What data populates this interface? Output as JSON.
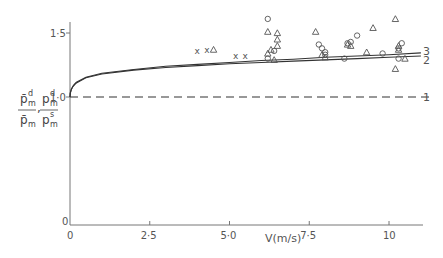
{
  "chart_data": {
    "type": "scatter",
    "title": "",
    "xlabel": "V(m/s)",
    "ylabel": "p̄_m^d / p̄_m , p_m^d / p_m^s",
    "xlim": [
      0,
      11.5
    ],
    "ylim": [
      0,
      1.6
    ],
    "x_ticks": [
      "0",
      "2·5",
      "5·0",
      "7·5",
      "10"
    ],
    "x_tick_values": [
      0,
      2.5,
      5.0,
      7.5,
      10
    ],
    "y_ticks": [
      "0",
      "1·0",
      "1·5"
    ],
    "y_tick_values": [
      0,
      1.0,
      1.5
    ],
    "grid": false,
    "curves": [
      {
        "name": "1",
        "style": "dashed",
        "x": [
          0,
          11.3
        ],
        "y": [
          1.0,
          1.0
        ]
      },
      {
        "name": "2",
        "style": "solid",
        "x": [
          0,
          0.2,
          0.5,
          1.0,
          2.0,
          3.0,
          4.0,
          5.0,
          6.0,
          7.0,
          8.0,
          9.0,
          10.0,
          11.0
        ],
        "y": [
          1.0,
          1.11,
          1.15,
          1.18,
          1.21,
          1.23,
          1.245,
          1.26,
          1.27,
          1.28,
          1.29,
          1.3,
          1.31,
          1.32
        ]
      },
      {
        "name": "3",
        "style": "solid",
        "x": [
          0,
          0.2,
          0.5,
          1.0,
          2.0,
          3.0,
          4.0,
          5.0,
          6.0,
          7.0,
          8.0,
          9.0,
          10.0,
          11.0
        ],
        "y": [
          1.0,
          1.115,
          1.155,
          1.185,
          1.215,
          1.24,
          1.255,
          1.27,
          1.285,
          1.295,
          1.31,
          1.32,
          1.33,
          1.345
        ]
      }
    ],
    "series": [
      {
        "name": "crosses",
        "marker": "x",
        "x": [
          4.0,
          4.3,
          5.2,
          5.5
        ],
        "y": [
          1.36,
          1.37,
          1.32,
          1.32
        ]
      },
      {
        "name": "circles",
        "marker": "o",
        "x": [
          6.2,
          6.4,
          6.2,
          7.8,
          7.9,
          8.0,
          8.0,
          8.7,
          8.8,
          9.0,
          8.6,
          9.8,
          10.3,
          10.4,
          10.3
        ],
        "y": [
          1.61,
          1.36,
          1.3,
          1.41,
          1.38,
          1.35,
          1.33,
          1.42,
          1.43,
          1.48,
          1.3,
          1.34,
          1.38,
          1.42,
          1.3
        ]
      },
      {
        "name": "triangles",
        "marker": "triangle",
        "x": [
          4.5,
          6.2,
          6.5,
          6.5,
          6.5,
          6.3,
          6.2,
          6.4,
          7.7,
          7.9,
          8.0,
          8.7,
          8.8,
          9.5,
          9.3,
          10.2,
          10.3,
          10.3,
          10.5,
          10.2
        ],
        "y": [
          1.37,
          1.51,
          1.5,
          1.45,
          1.4,
          1.37,
          1.34,
          1.29,
          1.51,
          1.33,
          1.31,
          1.41,
          1.4,
          1.54,
          1.35,
          1.61,
          1.4,
          1.37,
          1.3,
          1.22
        ]
      }
    ],
    "curve_labels": [
      "1",
      "2",
      "3"
    ]
  },
  "labels": {
    "xaxis": "V(m/s)",
    "curve1": "1",
    "curve2": "2",
    "curve3": "3",
    "y_num1": "p̄",
    "y_den1": "p̄",
    "y_num2": "p",
    "y_den2": "p",
    "sup_d": "d",
    "sub_m": "m",
    "sup_s": "s",
    "comma": ","
  }
}
